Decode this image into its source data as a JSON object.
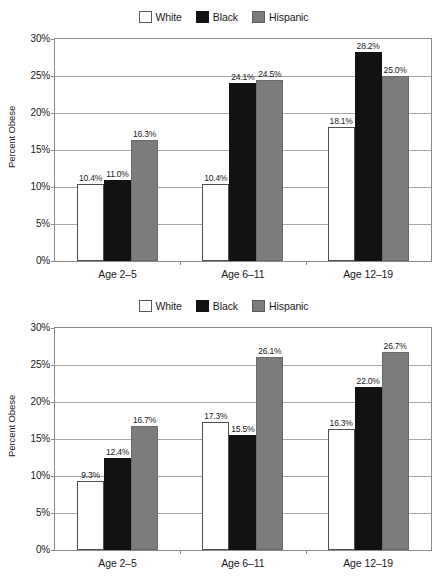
{
  "charts": [
    {
      "id": "chart-top",
      "name": "obesity-by-race-chart-1",
      "legend": {
        "position": "top-center",
        "items": [
          {
            "label": "White",
            "color": "#ffffff",
            "swatch": "sw-white"
          },
          {
            "label": "Black",
            "color": "#121212",
            "swatch": "sw-black"
          },
          {
            "label": "Hispanic",
            "color": "#7c7c7c",
            "swatch": "sw-hispanic"
          }
        ]
      },
      "chart_data": {
        "type": "bar",
        "title": "",
        "xlabel": "",
        "ylabel": "Percent Obese",
        "ylim": [
          0,
          30
        ],
        "ytick_labels": [
          "0%",
          "5%",
          "10%",
          "15%",
          "20%",
          "25%",
          "30%"
        ],
        "ytick_values": [
          0,
          5,
          10,
          15,
          20,
          25,
          30
        ],
        "grid": true,
        "legend_position": "top-center",
        "categories": [
          "Age 2–5",
          "Age 6–11",
          "Age 12–19"
        ],
        "series": [
          {
            "name": "White",
            "values": [
              10.4,
              10.4,
              18.1
            ],
            "labels": [
              "10.4%",
              "10.4%",
              "18.1%"
            ]
          },
          {
            "name": "Black",
            "values": [
              11.0,
              24.1,
              28.2
            ],
            "labels": [
              "11.0%",
              "24.1%",
              "28.2%"
            ]
          },
          {
            "name": "Hispanic",
            "values": [
              16.3,
              24.5,
              25.0
            ],
            "labels": [
              "16.3%",
              "24.5%",
              "25.0%"
            ]
          }
        ]
      }
    },
    {
      "id": "chart-bottom",
      "name": "obesity-by-race-chart-2",
      "legend": {
        "position": "top-center",
        "items": [
          {
            "label": "White",
            "color": "#ffffff",
            "swatch": "sw-white"
          },
          {
            "label": "Black",
            "color": "#121212",
            "swatch": "sw-black"
          },
          {
            "label": "Hispanic",
            "color": "#7c7c7c",
            "swatch": "sw-hispanic"
          }
        ]
      },
      "chart_data": {
        "type": "bar",
        "title": "",
        "xlabel": "",
        "ylabel": "Percent Obese",
        "ylim": [
          0,
          30
        ],
        "ytick_labels": [
          "0%",
          "5%",
          "10%",
          "15%",
          "20%",
          "25%",
          "30%"
        ],
        "ytick_values": [
          0,
          5,
          10,
          15,
          20,
          25,
          30
        ],
        "grid": true,
        "legend_position": "top-center",
        "categories": [
          "Age 2–5",
          "Age 6–11",
          "Age 12–19"
        ],
        "series": [
          {
            "name": "White",
            "values": [
              9.3,
              17.3,
              16.3
            ],
            "labels": [
              "9.3%",
              "17.3%",
              "16.3%"
            ]
          },
          {
            "name": "Black",
            "values": [
              12.4,
              15.5,
              22.0
            ],
            "labels": [
              "12.4%",
              "15.5%",
              "22.0%"
            ]
          },
          {
            "name": "Hispanic",
            "values": [
              16.7,
              26.1,
              26.7
            ],
            "labels": [
              "16.7%",
              "26.1%",
              "26.7%"
            ]
          }
        ]
      }
    }
  ]
}
